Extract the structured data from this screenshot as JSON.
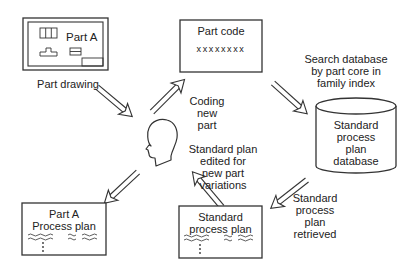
{
  "diagram": {
    "nodes": {
      "part_drawing": {
        "title": "Part A",
        "caption": "Part drawing"
      },
      "part_code": {
        "title": "Part code",
        "code": "xxxxxxxx"
      },
      "database": {
        "lines": [
          "Standard",
          "process",
          "plan",
          "database"
        ]
      },
      "standard_plan": {
        "lines": [
          "Standard",
          "process plan"
        ]
      },
      "part_a_plan": {
        "lines": [
          "Part A",
          "Process plan"
        ]
      },
      "planner": {
        "icon": "human-head-icon"
      }
    },
    "edge_labels": {
      "coding": [
        "Coding",
        "new",
        "part"
      ],
      "search": [
        "Search database",
        "by part core in",
        "family index"
      ],
      "retrieved": [
        "Standard",
        "process",
        "plan",
        "retrieved"
      ],
      "edited": [
        "Standard plan",
        "edited for",
        "new part",
        "variations"
      ]
    },
    "arrows": [
      {
        "from": "part_drawing",
        "to": "planner"
      },
      {
        "from": "planner",
        "to": "part_code"
      },
      {
        "from": "part_code",
        "to": "database"
      },
      {
        "from": "database",
        "to": "standard_plan"
      },
      {
        "from": "standard_plan",
        "to": "planner"
      },
      {
        "from": "planner",
        "to": "part_a_plan"
      }
    ],
    "colors": {
      "stroke": "#333333",
      "text": "#222222",
      "background": "#ffffff"
    }
  }
}
